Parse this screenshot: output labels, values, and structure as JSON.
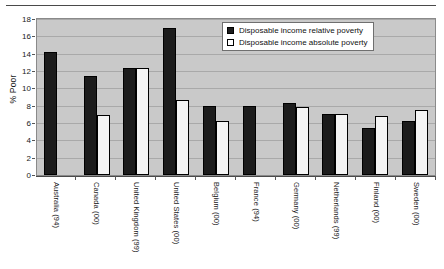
{
  "chart_data": {
    "type": "bar",
    "title": "",
    "xlabel": "",
    "ylabel": "% Poor",
    "ylim": [
      0,
      18
    ],
    "ytick_step": 2,
    "yticks": [
      0,
      2,
      4,
      6,
      8,
      10,
      12,
      14,
      16,
      18
    ],
    "grid": true,
    "legend_position": "top-right",
    "categories": [
      "Australia (94)",
      "Canada (00)",
      "United Kingdom (99)",
      "United States (00)",
      "Belgium (00)",
      "France (94)",
      "Germany (00)",
      "Netherlands (99)",
      "Finland (00)",
      "Sweden (00)"
    ],
    "series": [
      {
        "name": "Disposable income relative poverty",
        "color": "#1c1c1c",
        "values": [
          14.2,
          11.4,
          12.3,
          17.0,
          8.0,
          8.0,
          8.3,
          7.0,
          5.4,
          6.2
        ]
      },
      {
        "name": "Disposable income absolute poverty",
        "color": "#ffffff",
        "values": [
          null,
          6.9,
          12.3,
          8.7,
          6.2,
          null,
          7.8,
          7.0,
          6.8,
          7.5
        ]
      }
    ]
  },
  "legend": {
    "items": [
      {
        "label": "Disposable income relative poverty",
        "swatch": "black-square"
      },
      {
        "label": "Disposable income absolute poverty",
        "swatch": "white-square"
      }
    ]
  },
  "axes": {
    "y_title": "% Poor"
  },
  "colors": {
    "plot_background": "#c9c9c9",
    "gridline": "#a9a9a9",
    "series_relative": "#1c1c1c",
    "series_absolute": "#f4f4f4",
    "axis": "#4a4a4a"
  }
}
